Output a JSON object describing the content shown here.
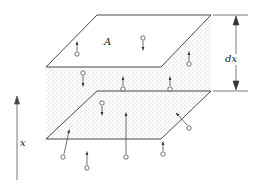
{
  "diagram": {
    "labels": {
      "area": "A",
      "thickness": "dx",
      "axis": "x"
    },
    "colors": {
      "line": "#333333",
      "stipple": "#9a9a9a",
      "plane_fill": "#ffffff",
      "background": "#ffffff"
    },
    "elements": {
      "top_plane": "parallelogram plane of area A",
      "bottom_plane": "parallelogram plane",
      "slab": "stippled slab of thickness dx between planes",
      "particles": "small circles with arrows indicating particle motion (up/down)"
    }
  }
}
